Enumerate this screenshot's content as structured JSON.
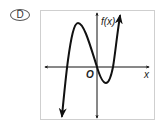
{
  "choice": {
    "letter": "D"
  },
  "graph": {
    "y_axis_label": "f(x)",
    "x_axis_label": "x",
    "origin_label": "O",
    "curve_color": "#111111",
    "axis_color": "#111111",
    "frame_color": "#cfcfcf",
    "description": "Cubic polynomial with positive leading coefficient: three real x-intercepts (one negative, one at origin, one positive), local maximum left of y-axis, local minimum right of y-axis."
  }
}
